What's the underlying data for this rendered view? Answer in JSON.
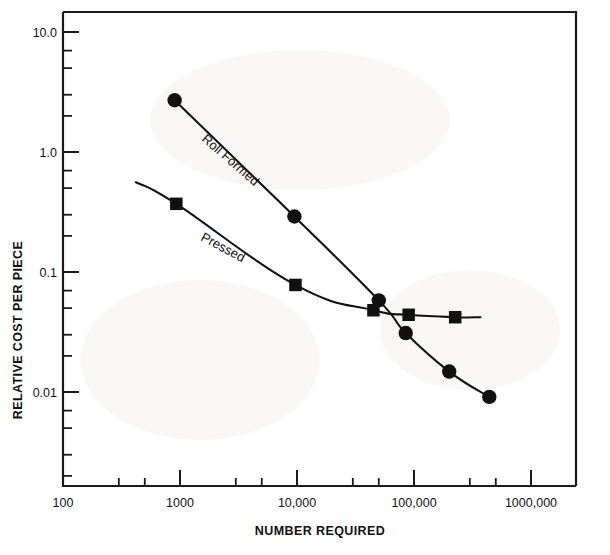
{
  "chart_data": {
    "type": "line",
    "title": "",
    "xlabel": "NUMBER REQUIRED",
    "ylabel": "RELATIVE COST PER PIECE",
    "xscale": "log",
    "yscale": "log",
    "xlim": [
      100,
      2000000
    ],
    "ylim": [
      0.002,
      20
    ],
    "grid": false,
    "legend_position": "inline-annotations",
    "x_tick_labels": [
      "100",
      "1000",
      "10,000",
      "100,000",
      "1000,000"
    ],
    "x_tick_values": [
      100,
      1000,
      10000,
      100000,
      1000000
    ],
    "y_tick_labels": [
      "10.0",
      "1.0",
      "0.1",
      "0.01"
    ],
    "y_tick_values": [
      10.0,
      1.0,
      0.1,
      0.01
    ],
    "series": [
      {
        "name": "Roll Formed",
        "marker": "circle",
        "label_text": "Roll Formed",
        "points": [
          {
            "x": 900,
            "y": 2.7
          },
          {
            "x": 9500,
            "y": 0.29
          },
          {
            "x": 50000,
            "y": 0.058
          },
          {
            "x": 85000,
            "y": 0.031
          },
          {
            "x": 200000,
            "y": 0.0148
          },
          {
            "x": 440000,
            "y": 0.0091
          }
        ]
      },
      {
        "name": "Pressed",
        "marker": "square",
        "label_text": "Pressed",
        "points": [
          {
            "x": 930,
            "y": 0.37
          },
          {
            "x": 9700,
            "y": 0.078
          },
          {
            "x": 45000,
            "y": 0.048
          },
          {
            "x": 90000,
            "y": 0.044
          },
          {
            "x": 225000,
            "y": 0.042
          }
        ],
        "lead_in_x": 420,
        "lead_in_y": 0.56,
        "tail_x": 370000,
        "tail_y": 0.042
      }
    ],
    "colors": {
      "ink": "#111111",
      "axis": "#1a1a1a",
      "background": "#ffffff"
    }
  },
  "annotations": {
    "roll_formed_label": "Roll Formed",
    "pressed_label": "Pressed"
  }
}
